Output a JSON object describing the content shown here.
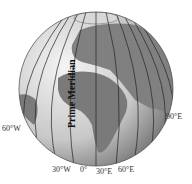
{
  "diagram": {
    "title": "Prime Meridian",
    "colors": {
      "land": "#7a7a7a",
      "ocean_lit": "#e6e6e6",
      "ocean_shade": "#9a9a9a",
      "meridian": "#222222",
      "label": "#333333"
    },
    "labels": {
      "w60": "60°W",
      "w30": "30°W",
      "zero": "0°",
      "e30": "30°E",
      "e60": "60°E",
      "e90": "90°E"
    }
  }
}
